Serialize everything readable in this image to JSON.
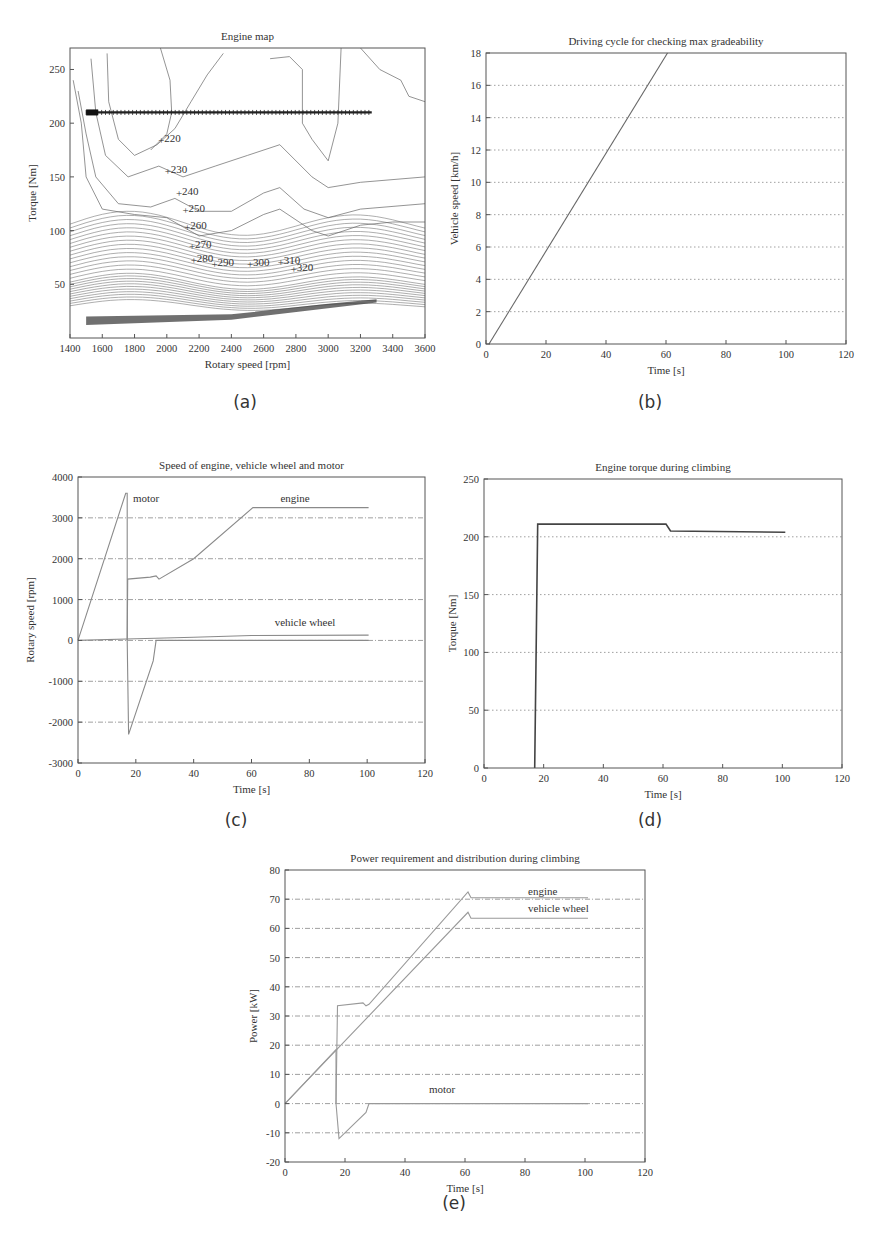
{
  "chart_data": [
    {
      "id": "a",
      "type": "contour",
      "caption": "(a)",
      "title": "Engine map",
      "xlabel": "Rotary speed [rpm]",
      "ylabel": "Torque [Nm]",
      "xlim": [
        1400,
        3600
      ],
      "ylim": [
        0,
        270
      ],
      "xticks": [
        1400,
        1600,
        1800,
        2000,
        2200,
        2400,
        2600,
        2800,
        3000,
        3200,
        3400,
        3600
      ],
      "yticks": [
        50,
        100,
        150,
        200,
        250
      ],
      "grid": false,
      "contour_labels": [
        {
          "label": "220",
          "x": 1960,
          "y": 183
        },
        {
          "label": "230",
          "x": 2000,
          "y": 155
        },
        {
          "label": "240",
          "x": 2070,
          "y": 134
        },
        {
          "label": "250",
          "x": 2110,
          "y": 118
        },
        {
          "label": "260",
          "x": 2120,
          "y": 102
        },
        {
          "label": "270",
          "x": 2150,
          "y": 85
        },
        {
          "label": "280",
          "x": 2160,
          "y": 72
        },
        {
          "label": "290",
          "x": 2290,
          "y": 68
        },
        {
          "label": "300",
          "x": 2510,
          "y": 68
        },
        {
          "label": "310",
          "x": 2700,
          "y": 70
        },
        {
          "label": "320",
          "x": 2780,
          "y": 63
        }
      ],
      "operating_points": {
        "torque": 210,
        "rpm_range": [
          1500,
          3270
        ]
      }
    },
    {
      "id": "b",
      "type": "line",
      "caption": "(b)",
      "title": "Driving cycle for checking max gradeability",
      "xlabel": "Time [s]",
      "ylabel": "Vehicle speed [km/h]",
      "xlim": [
        0,
        120
      ],
      "ylim": [
        0,
        18
      ],
      "xticks": [
        0,
        20,
        40,
        60,
        80,
        100,
        120
      ],
      "yticks": [
        0,
        2,
        4,
        6,
        8,
        10,
        12,
        14,
        16,
        18
      ],
      "grid": "y-dotted",
      "series": [
        {
          "name": "vehicle speed",
          "x": [
            1,
            60.5
          ],
          "y": [
            0,
            18
          ]
        }
      ]
    },
    {
      "id": "c",
      "type": "line",
      "caption": "(c)",
      "title": "Speed of engine, vehicle wheel and motor",
      "xlabel": "Time [s]",
      "ylabel": "Rotary speed [rpm]",
      "xlim": [
        0,
        120
      ],
      "ylim": [
        -3000,
        4000
      ],
      "xticks": [
        0,
        20,
        40,
        60,
        80,
        100,
        120
      ],
      "yticks": [
        -3000,
        -2000,
        -1000,
        0,
        1000,
        2000,
        3000,
        4000
      ],
      "grid": "y-dashdot",
      "series": [
        {
          "name": "motor",
          "x": [
            0,
            16.5,
            17,
            17,
            17.5,
            26,
            27,
            100.5
          ],
          "y": [
            0,
            3600,
            3600,
            0,
            -2300,
            -500,
            0,
            0
          ]
        },
        {
          "name": "engine",
          "x": [
            17,
            17.2,
            25,
            27,
            28,
            40,
            60.5,
            100.5
          ],
          "y": [
            0,
            1500,
            1550,
            1580,
            1500,
            2000,
            3250,
            3250
          ]
        },
        {
          "name": "vehicle wheel",
          "x": [
            0,
            20,
            40,
            60,
            100.5
          ],
          "y": [
            0,
            40,
            80,
            120,
            130
          ]
        }
      ],
      "annotations": [
        {
          "text": "motor",
          "x": 19,
          "y": 3400
        },
        {
          "text": "engine",
          "x": 70,
          "y": 3400
        },
        {
          "text": "vehicle wheel",
          "x": 68,
          "y": 350
        }
      ]
    },
    {
      "id": "d",
      "type": "line",
      "caption": "(d)",
      "title": "Engine torque during climbing",
      "xlabel": "Time [s]",
      "ylabel": "Torque [Nm]",
      "xlim": [
        0,
        120
      ],
      "ylim": [
        0,
        250
      ],
      "xticks": [
        0,
        20,
        40,
        60,
        80,
        100,
        120
      ],
      "yticks": [
        0,
        50,
        100,
        150,
        200,
        250
      ],
      "grid": "y-dotted",
      "series": [
        {
          "name": "engine torque",
          "x": [
            17,
            18,
            61,
            62.5,
            101
          ],
          "y": [
            0,
            211,
            211,
            205,
            204
          ]
        }
      ]
    },
    {
      "id": "e",
      "type": "line",
      "caption": "(e)",
      "title": "Power requirement and distribution during climbing",
      "xlabel": "Time [s]",
      "ylabel": "Power [kW]",
      "xlim": [
        0,
        120
      ],
      "ylim": [
        -20,
        80
      ],
      "xticks": [
        0,
        20,
        40,
        60,
        80,
        100,
        120
      ],
      "yticks": [
        -20,
        -10,
        0,
        10,
        20,
        30,
        40,
        50,
        60,
        70,
        80
      ],
      "grid": "y-dashdot",
      "series": [
        {
          "name": "engine",
          "x": [
            17,
            17.5,
            26,
            27,
            28,
            61,
            62,
            101
          ],
          "y": [
            0,
            33.5,
            34.5,
            33.5,
            34,
            72.5,
            70.5,
            70.5
          ]
        },
        {
          "name": "vehicle wheel",
          "x": [
            0,
            61,
            62,
            101
          ],
          "y": [
            0,
            65.5,
            63.5,
            63.5
          ]
        },
        {
          "name": "motor",
          "x": [
            0,
            17,
            17,
            18,
            27,
            28,
            101
          ],
          "y": [
            0,
            18.5,
            0,
            -12,
            -3,
            0,
            0
          ]
        }
      ],
      "annotations": [
        {
          "text": "engine",
          "x": 81,
          "y": 71.5
        },
        {
          "text": "vehicle wheel",
          "x": 81,
          "y": 65.5
        },
        {
          "text": "motor",
          "x": 48,
          "y": 3.5
        }
      ]
    }
  ]
}
